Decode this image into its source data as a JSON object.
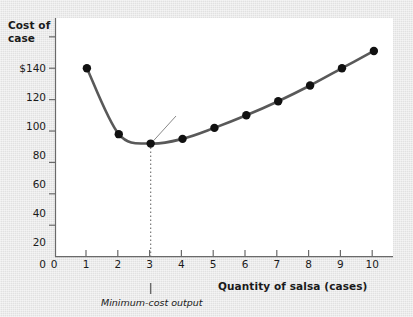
{
  "chart_data": {
    "type": "line",
    "title": "",
    "xlabel": "Quantity of salsa (cases)",
    "ylabel": "Cost of case",
    "x": [
      1,
      2,
      3,
      4,
      5,
      6,
      7,
      8,
      9,
      10
    ],
    "values": [
      120,
      78,
      72,
      75,
      82,
      90,
      99,
      109,
      120,
      131
    ],
    "series": [
      {
        "name": "Average total cost, ATC",
        "values": [
          120,
          78,
          72,
          75,
          82,
          90,
          99,
          109,
          120,
          131
        ]
      }
    ],
    "xlim": [
      0,
      10.6
    ],
    "ylim": [
      0,
      152
    ],
    "xticks": [
      "0",
      "1",
      "2",
      "3",
      "4",
      "5",
      "6",
      "7",
      "8",
      "9",
      "10"
    ],
    "yticks": [
      "0",
      "20",
      "40",
      "60",
      "80",
      "100",
      "120",
      "$140"
    ],
    "ytick_values": [
      0,
      20,
      40,
      60,
      80,
      100,
      120,
      140
    ],
    "grid": false,
    "legend_position": "inline-upper-right",
    "annotations": [
      {
        "name": "minimum-point-marker",
        "text": "M",
        "x": 3,
        "y": 72
      },
      {
        "name": "callout",
        "text": "Minimum average total cost",
        "lines": [
          "Minimum",
          "average",
          "total cost"
        ],
        "points_to_x": 3,
        "points_to_y": 72
      },
      {
        "name": "series-label",
        "text_plain": "Average total cost, ",
        "text_italic": "ATC"
      },
      {
        "name": "minimum-cost-output-note",
        "text": "Minimum-cost output",
        "x": 3
      }
    ],
    "colors": {
      "curve": "#545454",
      "marker": "#111111",
      "axis": "#5a5a5a",
      "plot_background": "#ffffff",
      "page_background": "#e8e8e8",
      "callout_background": "#dcdcdc",
      "text": "#1a1a1a"
    }
  },
  "axis_titles": {
    "y_line1": "Cost of",
    "y_line2": "case",
    "x": "Quantity of salsa (cases)"
  }
}
